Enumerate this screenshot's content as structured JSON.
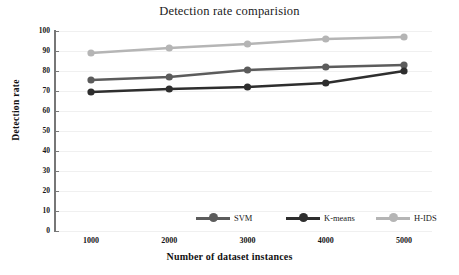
{
  "chart_data": {
    "type": "line",
    "title": "Detection rate comparision",
    "xlabel": "Number of dataset instances",
    "ylabel": "Detection rate",
    "categories": [
      "1000",
      "2000",
      "3000",
      "4000",
      "5000"
    ],
    "x": [
      1000,
      2000,
      3000,
      4000,
      5000
    ],
    "xlim": [
      1000,
      5000
    ],
    "ylim": [
      0,
      100
    ],
    "yticks": [
      0,
      10,
      20,
      30,
      40,
      50,
      60,
      70,
      80,
      90,
      100
    ],
    "grid": true,
    "legend_position": "bottom-center",
    "series": [
      {
        "name": "SVM",
        "color": "#5c5c5c",
        "values": [
          75.5,
          77.0,
          80.5,
          82.0,
          83.0
        ]
      },
      {
        "name": "K-means",
        "color": "#2e2e2e",
        "values": [
          69.5,
          71.0,
          72.0,
          74.0,
          80.0
        ]
      },
      {
        "name": "H-IDS",
        "color": "#b5b5b5",
        "values": [
          89.0,
          91.5,
          93.5,
          96.0,
          97.0
        ]
      }
    ]
  },
  "axes": {
    "y_tick_labels": [
      "100",
      "90",
      "80",
      "70",
      "60",
      "50",
      "40",
      "30",
      "20",
      "10",
      "0"
    ],
    "x_tick_labels": [
      "1000",
      "2000",
      "3000",
      "4000",
      "5000"
    ]
  },
  "legend": {
    "items": [
      {
        "label": "SVM"
      },
      {
        "label": "K-means"
      },
      {
        "label": "H-IDS"
      }
    ]
  },
  "colors": {
    "svm": "#5c5c5c",
    "kmeans": "#2e2e2e",
    "hids": "#b5b5b5",
    "axis": "#777777",
    "grid": "#f0f0f0",
    "background": "#ffffff"
  }
}
